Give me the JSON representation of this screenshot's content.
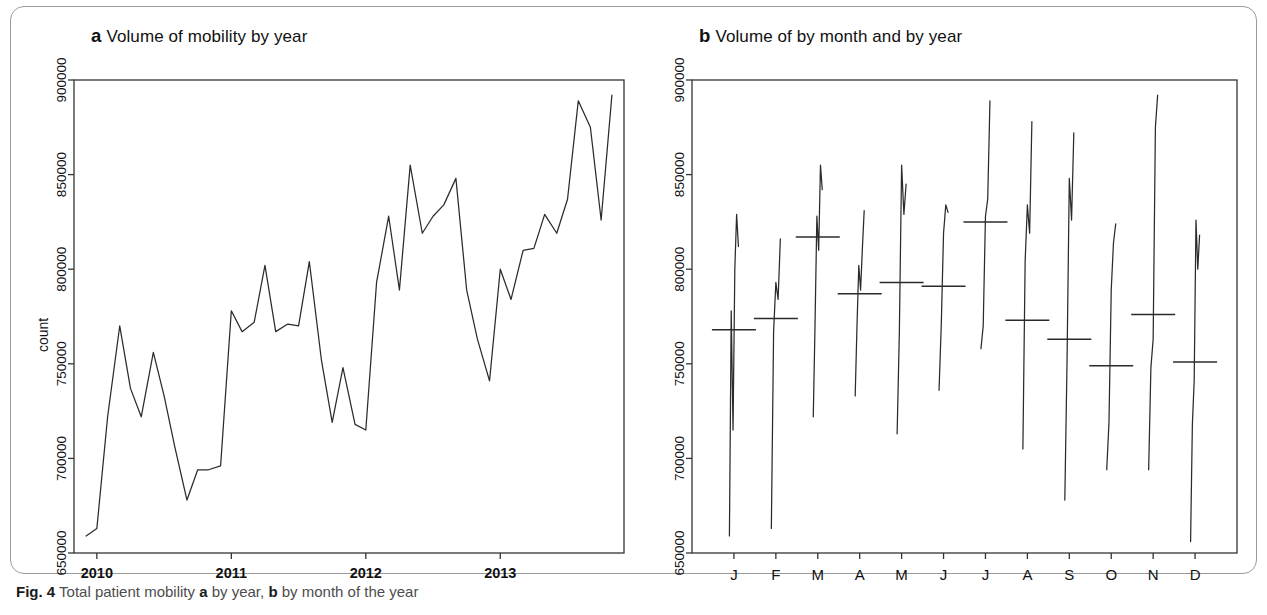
{
  "figure": {
    "caption_number": "Fig. 4",
    "caption_text_1": "Total patient mobility ",
    "caption_panel_a": "a",
    "caption_text_2": " by year, ",
    "caption_panel_b": "b",
    "caption_text_3": " by month of the year",
    "line_color": "#2b2b2b",
    "frame_color": "#333333",
    "card_border_color": "#9a9a9a"
  },
  "panel_a": {
    "letter": "a",
    "title": "Volume of mobility by year"
  },
  "panel_b": {
    "letter": "b",
    "title": "Volume of by month and by year"
  },
  "chart_data": [
    {
      "type": "line",
      "panel": "a",
      "title": "Volume of mobility by year",
      "xlabel": "",
      "ylabel": "count",
      "ylim": [
        650000,
        900000
      ],
      "yticks": [
        650000,
        700000,
        750000,
        800000,
        850000,
        900000
      ],
      "ytick_labels": [
        "650000",
        "700000",
        "750000",
        "800000",
        "850000",
        "900000"
      ],
      "xlim": [
        2009.83,
        2013.92
      ],
      "xticks": [
        2010,
        2011,
        2012,
        2013
      ],
      "xtick_labels": [
        "2010",
        "2011",
        "2012",
        "2013"
      ],
      "grid": false,
      "legend": "none",
      "x": [
        2009.92,
        2010.0,
        2010.08,
        2010.17,
        2010.25,
        2010.33,
        2010.42,
        2010.5,
        2010.58,
        2010.67,
        2010.75,
        2010.83,
        2010.92,
        2011.0,
        2011.08,
        2011.17,
        2011.25,
        2011.33,
        2011.42,
        2011.5,
        2011.58,
        2011.67,
        2011.75,
        2011.83,
        2011.92,
        2012.0,
        2012.08,
        2012.17,
        2012.25,
        2012.33,
        2012.42,
        2012.5,
        2012.58,
        2012.67,
        2012.75,
        2012.83,
        2012.92,
        2013.0,
        2013.08,
        2013.17,
        2013.25,
        2013.33,
        2013.42,
        2013.5,
        2013.58,
        2013.67,
        2013.75,
        2013.83
      ],
      "values": [
        659000,
        663000,
        722000,
        770000,
        737000,
        722000,
        756000,
        733000,
        706000,
        678000,
        694000,
        694000,
        696000,
        778000,
        767000,
        772000,
        802000,
        767000,
        771000,
        770000,
        804000,
        752000,
        719000,
        748000,
        718000,
        715000,
        793000,
        828000,
        789000,
        855000,
        819000,
        828000,
        834000,
        848000,
        789000,
        763000,
        741000,
        800000,
        784000,
        810000,
        811000,
        829000,
        819000,
        837000,
        889000,
        875000,
        826000,
        892000
      ]
    },
    {
      "type": "line",
      "panel": "b",
      "title": "Volume of by month and by year",
      "xlabel": "",
      "ylabel": "",
      "ylim": [
        650000,
        900000
      ],
      "yticks": [
        650000,
        700000,
        750000,
        800000,
        850000,
        900000
      ],
      "ytick_labels": [
        "650000",
        "700000",
        "750000",
        "800000",
        "850000",
        "900000"
      ],
      "xticks": [
        1,
        2,
        3,
        4,
        5,
        6,
        7,
        8,
        9,
        10,
        11,
        12
      ],
      "xtick_labels": [
        "J",
        "F",
        "M",
        "A",
        "M",
        "J",
        "J",
        "A",
        "S",
        "O",
        "N",
        "D"
      ],
      "grid": false,
      "legend": "none",
      "months": [
        {
          "label": "J",
          "mean": 768000,
          "points": [
            659000,
            778000,
            715000,
            800000,
            829000,
            812000
          ]
        },
        {
          "label": "F",
          "mean": 774000,
          "points": [
            663000,
            767000,
            793000,
            784000,
            816000
          ]
        },
        {
          "label": "M",
          "mean": 817000,
          "points": [
            722000,
            772000,
            828000,
            810000,
            855000,
            842000
          ]
        },
        {
          "label": "A",
          "mean": 787000,
          "points": [
            733000,
            770000,
            802000,
            789000,
            811000,
            831000
          ]
        },
        {
          "label": "M",
          "mean": 793000,
          "points": [
            713000,
            767000,
            855000,
            829000,
            845000
          ]
        },
        {
          "label": "J",
          "mean": 791000,
          "points": [
            736000,
            771000,
            819000,
            834000,
            830000
          ]
        },
        {
          "label": "J",
          "mean": 825000,
          "points": [
            758000,
            770000,
            828000,
            837000,
            889000
          ]
        },
        {
          "label": "A",
          "mean": 773000,
          "points": [
            705000,
            804000,
            834000,
            819000,
            878000
          ]
        },
        {
          "label": "S",
          "mean": 763000,
          "points": [
            678000,
            752000,
            848000,
            826000,
            872000
          ]
        },
        {
          "label": "O",
          "mean": 749000,
          "points": [
            694000,
            719000,
            789000,
            814000,
            824000
          ]
        },
        {
          "label": "N",
          "mean": 776000,
          "points": [
            694000,
            748000,
            763000,
            875000,
            892000
          ]
        },
        {
          "label": "D",
          "mean": 751000,
          "points": [
            656000,
            718000,
            741000,
            826000,
            800000,
            818000
          ]
        }
      ]
    }
  ]
}
